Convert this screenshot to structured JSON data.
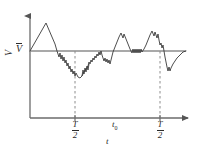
{
  "figure": {
    "caption_present": false,
    "axes": {
      "y": {
        "quantity_label": "V",
        "mean_label": "V",
        "mean_label_has_overbar": true,
        "arrow": "up"
      },
      "x": {
        "variable_label": "t",
        "arrow": "right",
        "ticks": [
          {
            "id": "tick-left",
            "numerator": "T",
            "denominator": "2",
            "x_px": 75
          },
          {
            "id": "tick-right",
            "numerator": "T",
            "denominator": "2",
            "x_px": 160
          }
        ],
        "interval_label": "t",
        "interval_label_sub": "0"
      }
    },
    "colors": {
      "axis": "#6b6b6b",
      "trace": "#3a3a3a",
      "mean_line": "#8c8c8c",
      "dashed": "#8c8c8c",
      "text": "#2b2b2b",
      "background": "#ffffff"
    }
  },
  "chart_data": {
    "type": "line",
    "title": "",
    "xlabel": "t",
    "ylabel": "V",
    "xlim": [
      0,
      200
    ],
    "ylim": [
      0,
      154
    ],
    "grid": false,
    "legend": null,
    "annotations": [
      {
        "text": "V",
        "overbar": true,
        "role": "mean-value-label",
        "x": 20,
        "y": 48
      },
      {
        "text": "V",
        "role": "y-axis-quantity",
        "x": 8,
        "y": 62
      },
      {
        "text": "T/2",
        "role": "x-tick-label",
        "x": 75,
        "y": 128
      },
      {
        "text": "t0",
        "role": "interval-label",
        "x": 117,
        "y": 124
      },
      {
        "text": "T/2",
        "role": "x-tick-label",
        "x": 160,
        "y": 128
      },
      {
        "text": "t",
        "role": "x-axis-variable",
        "x": 108,
        "y": 141
      }
    ],
    "reference_lines": [
      {
        "name": "mean-line",
        "orientation": "horizontal",
        "y": 51,
        "x_start": 30,
        "x_end": 186,
        "style": "solid"
      },
      {
        "name": "marker-left",
        "orientation": "vertical",
        "x": 75,
        "y_start": 51,
        "y_end": 118,
        "style": "dashed"
      },
      {
        "name": "marker-right",
        "orientation": "vertical",
        "x": 160,
        "y_start": 51,
        "y_end": 118,
        "style": "dashed"
      }
    ],
    "axis_lines": [
      {
        "name": "y-axis",
        "x": 30,
        "y_start": 14,
        "y_end": 118
      },
      {
        "name": "x-axis",
        "y": 118,
        "x_start": 30,
        "x_end": 190
      }
    ],
    "series": [
      {
        "name": "fluctuating-signal",
        "points": [
          [
            30,
            51
          ],
          [
            34,
            44
          ],
          [
            38,
            37
          ],
          [
            42,
            30
          ],
          [
            46,
            23
          ],
          [
            49,
            30
          ],
          [
            52,
            37
          ],
          [
            55,
            44
          ],
          [
            57,
            51
          ],
          [
            59,
            57
          ],
          [
            60,
            53
          ],
          [
            61,
            59
          ],
          [
            62,
            55
          ],
          [
            63,
            61
          ],
          [
            64,
            57
          ],
          [
            65,
            63
          ],
          [
            66,
            60
          ],
          [
            67,
            66
          ],
          [
            68,
            63
          ],
          [
            69,
            69
          ],
          [
            70,
            66
          ],
          [
            71,
            72
          ],
          [
            72,
            69
          ],
          [
            73,
            74
          ],
          [
            74,
            71
          ],
          [
            75,
            76
          ],
          [
            76,
            73
          ],
          [
            78,
            77
          ],
          [
            80,
            78
          ],
          [
            82,
            76
          ],
          [
            84,
            72
          ],
          [
            86,
            69
          ],
          [
            88,
            66
          ],
          [
            89,
            62
          ],
          [
            90,
            64
          ],
          [
            91,
            60
          ],
          [
            92,
            62
          ],
          [
            93,
            58
          ],
          [
            94,
            60
          ],
          [
            95,
            56
          ],
          [
            96,
            58
          ],
          [
            97,
            54
          ],
          [
            98,
            56
          ],
          [
            99,
            52
          ],
          [
            100,
            55
          ],
          [
            101,
            51
          ],
          [
            102,
            55
          ],
          [
            103,
            58
          ],
          [
            104,
            61
          ],
          [
            105,
            58
          ],
          [
            106,
            62
          ],
          [
            107,
            59
          ],
          [
            108,
            63
          ],
          [
            109,
            60
          ],
          [
            110,
            64
          ],
          [
            111,
            60
          ],
          [
            112,
            56
          ],
          [
            113,
            52
          ],
          [
            115,
            47
          ],
          [
            117,
            42
          ],
          [
            119,
            37
          ],
          [
            121,
            33
          ],
          [
            123,
            38
          ],
          [
            124,
            34
          ],
          [
            126,
            39
          ],
          [
            128,
            44
          ],
          [
            130,
            49
          ],
          [
            132,
            53
          ],
          [
            133,
            49
          ],
          [
            134,
            53
          ],
          [
            135,
            49
          ],
          [
            136,
            53
          ],
          [
            137,
            49
          ],
          [
            138,
            53
          ],
          [
            139,
            49
          ],
          [
            140,
            53
          ],
          [
            141,
            49
          ],
          [
            142,
            52
          ],
          [
            144,
            49
          ],
          [
            146,
            45
          ],
          [
            148,
            40
          ],
          [
            150,
            35
          ],
          [
            152,
            31
          ],
          [
            154,
            36
          ],
          [
            155,
            32
          ],
          [
            157,
            38
          ],
          [
            158,
            34
          ],
          [
            159,
            40
          ],
          [
            160,
            45
          ],
          [
            161,
            43
          ],
          [
            162,
            48
          ],
          [
            163,
            45
          ],
          [
            164,
            51
          ],
          [
            165,
            57
          ],
          [
            166,
            62
          ],
          [
            167,
            67
          ],
          [
            168,
            71
          ],
          [
            169,
            67
          ],
          [
            170,
            71
          ],
          [
            171,
            68
          ],
          [
            173,
            64
          ],
          [
            175,
            61
          ],
          [
            177,
            58
          ],
          [
            179,
            56
          ],
          [
            181,
            54
          ],
          [
            183,
            52
          ],
          [
            186,
            51
          ]
        ],
        "description": "Random fluctuating instantaneous value crossing the mean level"
      },
      {
        "name": "fluctuating-signal-segment-b",
        "points": [
          [
            82,
            76
          ],
          [
            83,
            70
          ],
          [
            84,
            74
          ],
          [
            85,
            68
          ],
          [
            86,
            72
          ],
          [
            87,
            66
          ],
          [
            88,
            70
          ],
          [
            89,
            64
          ]
        ],
        "description": "Fine jitter detail in the descending portion"
      }
    ]
  }
}
